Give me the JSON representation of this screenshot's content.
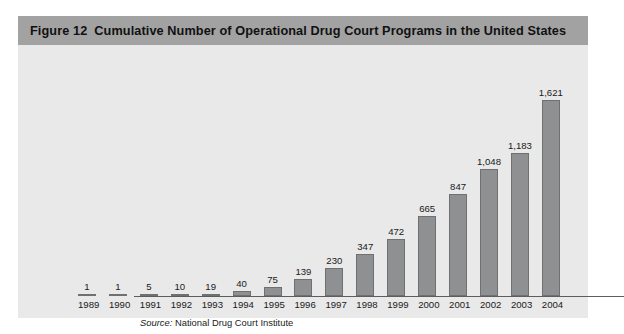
{
  "figure": {
    "number": "Figure 12",
    "title": "Cumulative Number of Operational Drug Court Programs in the United States",
    "source_label": "Source:",
    "source_value": "National Drug Court Institute"
  },
  "colors": {
    "title_band": "#a2a2a2",
    "panel_background": "#e9e9e9",
    "bar_fill": "#8f9092",
    "bar_border": "#6f7072",
    "axis": "#5d5d5d",
    "text": "#1a1a1a"
  },
  "chart_data": {
    "type": "bar",
    "xlabel": "",
    "ylabel": "",
    "grid": false,
    "legend": "none",
    "ylim": [
      0,
      1621
    ],
    "axis_visible": "x-only",
    "data_labels": true,
    "categories": [
      "1989",
      "1990",
      "1991",
      "1992",
      "1993",
      "1994",
      "1995",
      "1996",
      "1997",
      "1998",
      "1999",
      "2000",
      "2001",
      "2002",
      "2003",
      "2004"
    ],
    "values": [
      1,
      1,
      5,
      10,
      19,
      40,
      75,
      139,
      230,
      347,
      472,
      665,
      847,
      1048,
      1183,
      1621
    ],
    "value_labels": [
      "1",
      "1",
      "5",
      "10",
      "19",
      "40",
      "75",
      "139",
      "230",
      "347",
      "472",
      "665",
      "847",
      "1,048",
      "1,183",
      "1,621"
    ],
    "source": "Source: National Drug Court Institute"
  }
}
